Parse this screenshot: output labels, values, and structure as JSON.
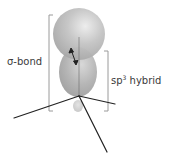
{
  "diagram": {
    "labels": {
      "sigma_bond": "σ-bond",
      "sp3_prefix": "sp",
      "sp3_superscript": "3",
      "sp3_suffix": " hybrid"
    },
    "colors": {
      "orbital_fill": "#b8b8b8",
      "orbital_highlight": "#e6e6e6",
      "bracket": "#9a9a9a",
      "bond_line": "#222222",
      "text": "#3a3a3a"
    },
    "elements": {
      "upper_orbital": "Large spherical orbital (bonding partner)",
      "lower_orbital": "sp3 hybrid orbital main lobe",
      "back_lobe": "sp3 hybrid orbital small back lobe",
      "overlap_arrow": "Double-headed arrow indicating orbital overlap",
      "bonds": 3
    }
  }
}
